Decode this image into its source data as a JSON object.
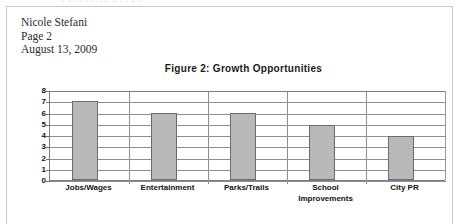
{
  "clipped_header_text": "CONFIDENTIAL",
  "letterhead": {
    "lines": [
      "Nicole Stefani",
      "Page 2",
      "August 13, 2009"
    ]
  },
  "chart_data": {
    "type": "bar",
    "title": "Figure 2:  Growth Opportunities",
    "categories": [
      "Jobs/Wages",
      "Entertainment",
      "Parks/Trails",
      "School Improvements",
      "City PR"
    ],
    "category_lines": [
      [
        "Jobs/Wages"
      ],
      [
        "Entertainment"
      ],
      [
        "Parks/Trails"
      ],
      [
        "School",
        "Improvements"
      ],
      [
        "City PR"
      ]
    ],
    "values": [
      7,
      6,
      6,
      4.9,
      3.9
    ],
    "xlabel": "",
    "ylabel": "",
    "ylim": [
      0,
      8
    ],
    "yticks": [
      0,
      1,
      2,
      3,
      4,
      5,
      6,
      7,
      8
    ],
    "grid": true,
    "legend": false,
    "bar_fill_color": "#b9b9b9",
    "bar_border_color": "#6c6c6c",
    "axis_color": "#7d7d7d",
    "grid_color": "#8e8e8e"
  }
}
